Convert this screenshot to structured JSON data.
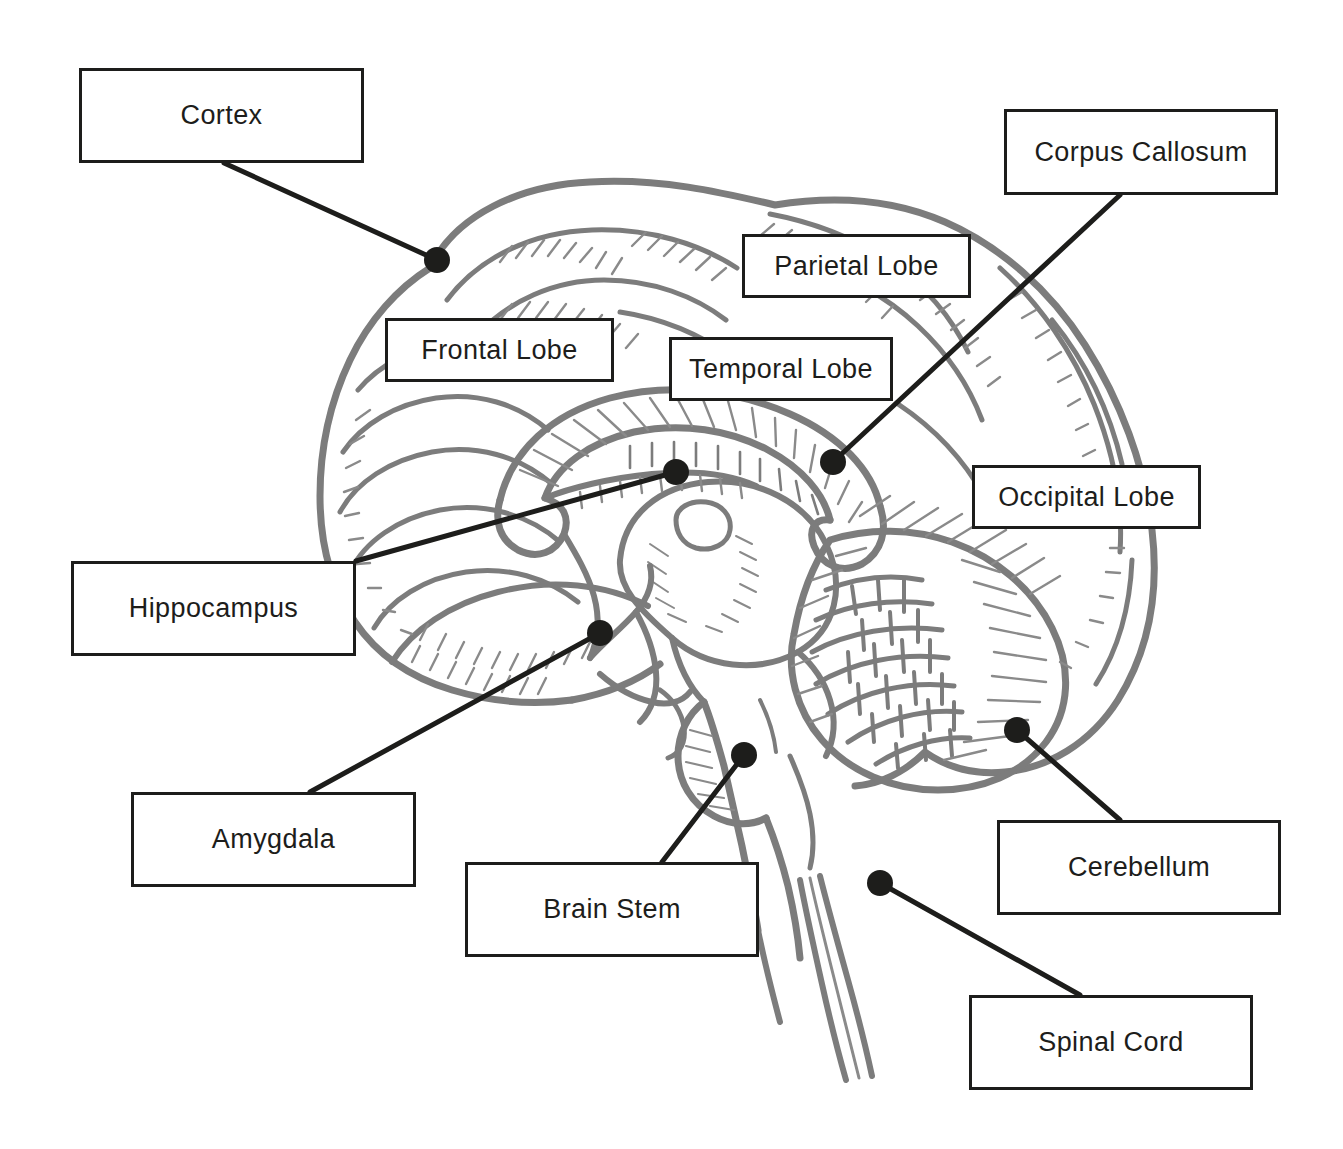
{
  "diagram": {
    "style": "black-and-white line art with boxed labels and leader lines",
    "colors": {
      "background": "#ffffff",
      "box_border": "#1d1d1b",
      "label_text": "#1d1d1b",
      "leader_line": "#1d1d1b",
      "anchor_dot": "#1d1d1b",
      "artwork_outline": "#7c7c7c",
      "artwork_detail": "#8a8a8a"
    },
    "labels": [
      {
        "id": "cortex",
        "text": "Cortex",
        "box": {
          "x": 79,
          "y": 68,
          "width": 285,
          "height": 95
        },
        "anchor": {
          "x": 437,
          "y": 260
        },
        "line_from": {
          "x": 224,
          "y": 163
        }
      },
      {
        "id": "corpus-callosum",
        "text": "Corpus Callosum",
        "box": {
          "x": 1004,
          "y": 109,
          "width": 274,
          "height": 86
        },
        "anchor": {
          "x": 833,
          "y": 462
        },
        "line_from": {
          "x": 1120,
          "y": 195
        }
      },
      {
        "id": "parietal-lobe",
        "text": "Parietal Lobe",
        "box": {
          "x": 742,
          "y": 234,
          "width": 229,
          "height": 64
        },
        "anchor": null,
        "line_from": null
      },
      {
        "id": "frontal-lobe",
        "text": "Frontal Lobe",
        "box": {
          "x": 385,
          "y": 318,
          "width": 229,
          "height": 64
        },
        "anchor": null,
        "line_from": null
      },
      {
        "id": "temporal-lobe",
        "text": "Temporal Lobe",
        "box": {
          "x": 669,
          "y": 337,
          "width": 224,
          "height": 64
        },
        "anchor": null,
        "line_from": null
      },
      {
        "id": "occipital-lobe",
        "text": "Occipital Lobe",
        "box": {
          "x": 972,
          "y": 465,
          "width": 229,
          "height": 64
        },
        "anchor": null,
        "line_from": null
      },
      {
        "id": "hippocampus",
        "text": "Hippocampus",
        "box": {
          "x": 71,
          "y": 561,
          "width": 285,
          "height": 95
        },
        "anchor": {
          "x": 676,
          "y": 472
        },
        "line_from": {
          "x": 356,
          "y": 561
        }
      },
      {
        "id": "amygdala",
        "text": "Amygdala",
        "box": {
          "x": 131,
          "y": 792,
          "width": 285,
          "height": 95
        },
        "anchor": {
          "x": 600,
          "y": 633
        },
        "line_from": {
          "x": 310,
          "y": 792
        }
      },
      {
        "id": "brain-stem",
        "text": "Brain Stem",
        "box": {
          "x": 465,
          "y": 862,
          "width": 294,
          "height": 95
        },
        "anchor": {
          "x": 744,
          "y": 755
        },
        "line_from": {
          "x": 662,
          "y": 862
        }
      },
      {
        "id": "cerebellum",
        "text": "Cerebellum",
        "box": {
          "x": 997,
          "y": 820,
          "width": 284,
          "height": 95
        },
        "anchor": {
          "x": 1017,
          "y": 730
        },
        "line_from": {
          "x": 1120,
          "y": 820
        }
      },
      {
        "id": "spinal-cord",
        "text": "Spinal Cord",
        "box": {
          "x": 969,
          "y": 995,
          "width": 284,
          "height": 95
        },
        "anchor": {
          "x": 880,
          "y": 883
        },
        "line_from": {
          "x": 1080,
          "y": 995
        }
      }
    ],
    "anchor_dot_radius": 13,
    "leader_line_width": 5
  }
}
